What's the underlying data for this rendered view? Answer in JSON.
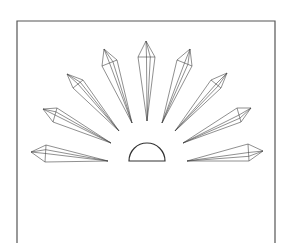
{
  "diagram": {
    "colors": {
      "stroke": "#444444",
      "frame": "#555555",
      "background": "#ffffff"
    },
    "frame": {
      "left": 17,
      "top": 21,
      "right": 275,
      "bottom": 243
    },
    "dome": {
      "x1": 129,
      "x2": 165,
      "baseline": 161,
      "radius": 18
    },
    "crystals": [
      {
        "name": "crystal-far-left",
        "apex": [
          31,
          152
        ],
        "s1": [
          46,
          145
        ],
        "s2": [
          45,
          162
        ],
        "tip": [
          108,
          161
        ]
      },
      {
        "name": "crystal-left-low",
        "apex": [
          43,
          109
        ],
        "s1": [
          57,
          108
        ],
        "s2": [
          53,
          122
        ],
        "tip": [
          111,
          143
        ]
      },
      {
        "name": "crystal-left-mid",
        "apex": [
          67,
          74
        ],
        "s1": [
          83,
          80
        ],
        "s2": [
          73,
          88
        ],
        "tip": [
          119,
          131
        ]
      },
      {
        "name": "crystal-left-high",
        "apex": [
          104,
          49
        ],
        "s1": [
          117,
          60
        ],
        "s2": [
          102,
          66
        ],
        "tip": [
          132,
          123
        ]
      },
      {
        "name": "crystal-center",
        "apex": [
          146,
          41
        ],
        "s1": [
          155,
          57
        ],
        "s2": [
          138,
          57
        ],
        "tip": [
          147,
          121
        ]
      },
      {
        "name": "crystal-right-high",
        "apex": [
          190,
          49
        ],
        "s1": [
          192,
          66
        ],
        "s2": [
          177,
          60
        ],
        "tip": [
          162,
          123
        ]
      },
      {
        "name": "crystal-right-mid",
        "apex": [
          227,
          73
        ],
        "s1": [
          221,
          88
        ],
        "s2": [
          211,
          80
        ],
        "tip": [
          175,
          131
        ]
      },
      {
        "name": "crystal-right-low",
        "apex": [
          251,
          108
        ],
        "s1": [
          241,
          122
        ],
        "s2": [
          237,
          108
        ],
        "tip": [
          183,
          143
        ]
      },
      {
        "name": "crystal-far-right",
        "apex": [
          263,
          151
        ],
        "s1": [
          249,
          161
        ],
        "s2": [
          248,
          144
        ],
        "tip": [
          187,
          161
        ]
      }
    ]
  }
}
